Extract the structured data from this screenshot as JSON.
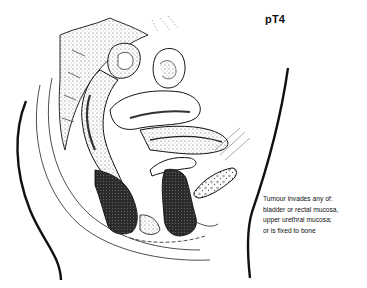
{
  "diagram": {
    "title": "pT4",
    "caption_lines": [
      "Tumour invades any of:",
      "bladder or rectal mucosa,",
      "upper urethral mucosa;",
      "or is fixed to bone"
    ],
    "colors": {
      "line": "#111111",
      "tumour_fill": "#3a3a3a",
      "tissue_shade": "#9a9a9a",
      "background": "#ffffff"
    },
    "regions": [
      {
        "name": "sacrum-spine"
      },
      {
        "name": "rectum"
      },
      {
        "name": "uterus"
      },
      {
        "name": "bladder"
      },
      {
        "name": "pubic-bone"
      },
      {
        "name": "vagina"
      },
      {
        "name": "tumour-mass"
      },
      {
        "name": "body-outline-back"
      },
      {
        "name": "body-outline-front"
      }
    ]
  }
}
